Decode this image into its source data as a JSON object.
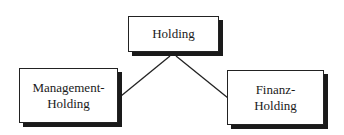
{
  "diagram": {
    "type": "hierarchy",
    "nodes": {
      "top": {
        "id": "holding",
        "lines": [
          "Holding"
        ]
      },
      "left": {
        "id": "management-holding",
        "lines": [
          "Management-",
          "Holding"
        ]
      },
      "right": {
        "id": "finanz-holding",
        "lines": [
          "Finanz-",
          "Holding"
        ]
      }
    },
    "edges": [
      {
        "from": "holding",
        "to": "management-holding"
      },
      {
        "from": "holding",
        "to": "finanz-holding"
      }
    ],
    "colors": {
      "stroke": "#222222",
      "shadow": "#1a1a1a",
      "fill": "#ffffff",
      "background": "#ffffff"
    }
  }
}
